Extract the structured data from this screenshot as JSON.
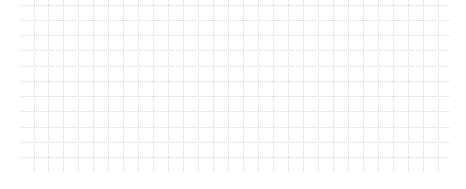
{
  "canvas": {
    "width": 466,
    "height": 189,
    "background": "#ffffff"
  },
  "grid": {
    "line_color": "#d8d8d8",
    "dash": "1,1",
    "horizontal": {
      "x_start": 20,
      "x_end": 450,
      "y_start": 4.5,
      "spacing": 15.25,
      "count": 11
    },
    "vertical": {
      "y_start": 0,
      "y_end": 172,
      "x_start": 33.5,
      "spacing": 14.97,
      "count": 28
    }
  }
}
